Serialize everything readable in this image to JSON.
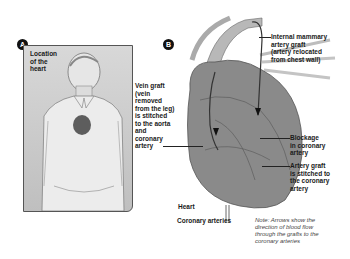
{
  "diagram": {
    "panels": [
      {
        "id": "A",
        "badge": "A",
        "labels": {
          "location": "Location\nof the\nheart"
        }
      },
      {
        "id": "B",
        "badge": "B",
        "labels": {
          "vein_graft": "Vein graft\n(vein\nremoved\nfrom the leg)\nis stitched\nto the aorta\nand\ncoronary\nartery",
          "mammary_graft": "Internal mammary\nartery graft\n(artery relocated\nfrom chest wall)",
          "blockage": "Blockage\nin coronary\nartery",
          "artery_graft": "Artery graft\nis stitched to\nthe coronary\nartery",
          "heart": "Heart",
          "coronary_arteries": "Coronary arteries",
          "note": "Note: Arrows show the\ndirection of blood flow\nthrough the grafts to the\ncoronary arteries"
        }
      }
    ],
    "colors": {
      "panel_bg": "#c8c8c8",
      "heart_tissue": "#7a7a7a",
      "chest_mark": "#3a3a3a",
      "text": "#1a1a1a"
    }
  }
}
